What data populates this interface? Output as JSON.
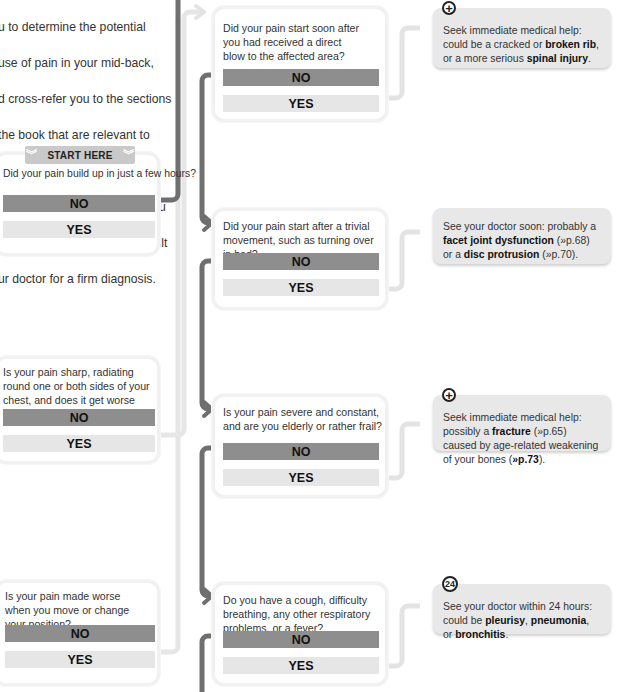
{
  "intro": {
    "lines": [
      "u to determine the potential",
      "use of pain in your mid-back,",
      "d cross-refer you to the sections",
      "the book that are relevant to",
      "at disorder. The chart is for",
      "ference only, however, and you",
      "ould always ensure you consult",
      "ur doctor for a firm diagnosis."
    ]
  },
  "start_here": {
    "label": "START HERE",
    "icon": "double-chevron-down-icon"
  },
  "answers": {
    "no": "NO",
    "yes": "YES"
  },
  "left_questions": [
    {
      "text": "Did your pain build up in just a few hours?"
    },
    {
      "text": "Is your pain sharp, radiating round one or both sides of your chest, and does it get worse when you breathe in?"
    },
    {
      "text": "Is your pain made worse when you move or change your position?"
    }
  ],
  "middle_questions": [
    {
      "text": "Did your pain start soon after you had received a direct blow to the affected area?"
    },
    {
      "text": "Did your pain start after a trivial movement, such as turning over in bed?"
    },
    {
      "text": "Is your pain severe and constant, and are you elderly or rather frail?"
    },
    {
      "text": "Do you have a cough, difficulty breathing, any other respiratory problems, or a fever?"
    }
  ],
  "results": [
    {
      "icon": "emergency-plus-icon",
      "icon_glyph": "+",
      "parts": [
        "Seek immediate medical help: could be a cracked or ",
        "broken rib",
        ", or a more serious ",
        "spinal injury",
        "."
      ]
    },
    {
      "icon": null,
      "parts": [
        "See your doctor soon: probably a ",
        "facet joint dysfunction",
        " (»p.68) or a ",
        "disc protrusion",
        " (»p.70)."
      ]
    },
    {
      "icon": "emergency-plus-icon",
      "icon_glyph": "+",
      "parts": [
        "Seek immediate medical help: possibly a ",
        "fracture",
        " (»p.65) caused by age-related weakening of your bones (",
        "»p.73",
        ")."
      ]
    },
    {
      "icon": "24-hours-icon",
      "icon_glyph": "24",
      "parts": [
        "See your doctor within 24 hours: could be ",
        "pleurisy",
        ", ",
        "pneumonia",
        ", or ",
        "bronchitis",
        "."
      ]
    }
  ],
  "colors": {
    "no_button": "#8e8e8e",
    "yes_button": "#e6e6e6",
    "no_path": "#6f6f6f",
    "yes_path": "#e3e3e3",
    "result_bg": "#e8e8e8",
    "card_border": "#f1f1f1"
  }
}
